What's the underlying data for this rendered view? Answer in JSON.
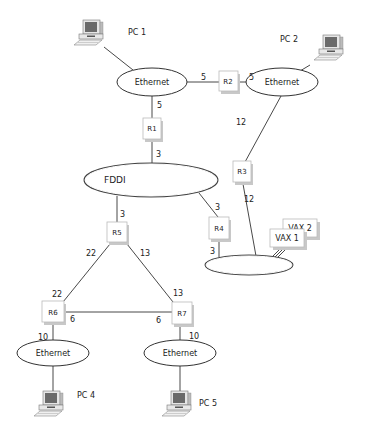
{
  "diagram": {
    "type": "network-topology",
    "computers": [
      {
        "id": "pc1",
        "label": "PC 1"
      },
      {
        "id": "pc2",
        "label": "PC 2"
      },
      {
        "id": "pc4",
        "label": "PC 4"
      },
      {
        "id": "pc5",
        "label": "PC 5"
      }
    ],
    "hosts": [
      {
        "id": "vax1",
        "label": "VAX 1"
      },
      {
        "id": "vax2",
        "label": "VAX 2"
      }
    ],
    "networks": [
      {
        "id": "eth1",
        "label": "Ethernet"
      },
      {
        "id": "eth2",
        "label": "Ethernet"
      },
      {
        "id": "fddi",
        "label": "FDDI"
      },
      {
        "id": "ring",
        "label": ""
      },
      {
        "id": "eth4",
        "label": "Ethernet"
      },
      {
        "id": "eth5",
        "label": "Ethernet"
      }
    ],
    "routers": [
      {
        "id": "r1",
        "label": "R1"
      },
      {
        "id": "r2",
        "label": "R2"
      },
      {
        "id": "r3",
        "label": "R3"
      },
      {
        "id": "r4",
        "label": "R4"
      },
      {
        "id": "r5",
        "label": "R5"
      },
      {
        "id": "r6",
        "label": "R6"
      },
      {
        "id": "r7",
        "label": "R7"
      }
    ],
    "links": [
      {
        "from": "pc1",
        "to": "eth1",
        "cost": ""
      },
      {
        "from": "eth1",
        "to": "r2",
        "cost": "5"
      },
      {
        "from": "r2",
        "to": "eth2",
        "cost": "5"
      },
      {
        "from": "pc2",
        "to": "eth2",
        "cost": ""
      },
      {
        "from": "eth1",
        "to": "r1",
        "cost": "5"
      },
      {
        "from": "r1",
        "to": "fddi",
        "cost": "3"
      },
      {
        "from": "eth2",
        "to": "r3",
        "cost": "12"
      },
      {
        "from": "r3",
        "to": "ring",
        "cost": "12"
      },
      {
        "from": "fddi",
        "to": "r4",
        "cost": "3"
      },
      {
        "from": "r4",
        "to": "ring",
        "cost": "3"
      },
      {
        "from": "fddi",
        "to": "r5",
        "cost": "3"
      },
      {
        "from": "r5",
        "to": "r6",
        "cost": "22",
        "cost_end": "22"
      },
      {
        "from": "r5",
        "to": "r7",
        "cost": "13",
        "cost_end": "13"
      },
      {
        "from": "r6",
        "to": "r7",
        "cost": "6",
        "cost_end": "6"
      },
      {
        "from": "r6",
        "to": "eth4",
        "cost": "10"
      },
      {
        "from": "r7",
        "to": "eth5",
        "cost": "10"
      },
      {
        "from": "eth4",
        "to": "pc4",
        "cost": ""
      },
      {
        "from": "eth5",
        "to": "pc5",
        "cost": ""
      },
      {
        "from": "ring",
        "to": "vax1",
        "cost": ""
      },
      {
        "from": "ring",
        "to": "vax2",
        "cost": ""
      }
    ]
  },
  "labels": {
    "pc1": "PC 1",
    "pc2": "PC 2",
    "pc4": "PC 4",
    "pc5": "PC 5",
    "eth1": "Ethernet",
    "eth2": "Ethernet",
    "eth4": "Ethernet",
    "eth5": "Ethernet",
    "fddi": "FDDI",
    "r1": "R1",
    "r2": "R2",
    "r3": "R3",
    "r4": "R4",
    "r5": "R5",
    "r6": "R6",
    "r7": "R7",
    "vax1": "VAX 1",
    "vax2": "VAX 2"
  },
  "costs": {
    "eth1_r2": "5",
    "r2_eth2": "5",
    "eth1_r1": "5",
    "r1_fddi": "3",
    "eth2_r3": "12",
    "r3_ring": "12",
    "fddi_r4": "3",
    "r4_ring": "3",
    "fddi_r5": "3",
    "r5_r6": "22",
    "r6_r5": "22",
    "r5_r7": "13",
    "r7_r5": "13",
    "r6_r7": "6",
    "r7_r6": "6",
    "r6_eth4": "10",
    "r7_eth5": "10"
  }
}
